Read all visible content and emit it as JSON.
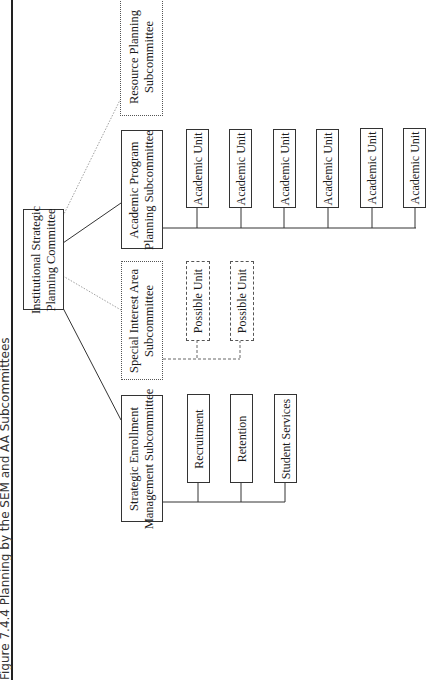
{
  "figure": {
    "title": "Figure 7.4.4 Planning by the SEM and AA Subcommittees"
  },
  "root": {
    "line1": "Institutional Strategic",
    "line2": "Planning Committee"
  },
  "subcommittees": {
    "resource": {
      "line1": "Resource Planning",
      "line2": "Subcommittee",
      "style": "dotted"
    },
    "academic": {
      "line1": "Academic Program",
      "line2": "Planning Subcommittee",
      "style": "solid"
    },
    "special": {
      "line1": "Special Interest Area",
      "line2": "Subcommittee",
      "style": "dotted"
    },
    "enrollment": {
      "line1": "Strategic Enrollment",
      "line2": "Management Subcommittee",
      "style": "solid"
    }
  },
  "academic_units": [
    "Academic Unit",
    "Academic Unit",
    "Academic Unit",
    "Academic Unit",
    "Academic Unit",
    "Academic Unit"
  ],
  "possible_units": [
    "Possible Unit",
    "Possible Unit"
  ],
  "enrollment_units": [
    "Recruitment",
    "Retention",
    "Student Services"
  ],
  "colors": {
    "line": "#333333",
    "dotted_line": "#777777",
    "background": "#ffffff"
  }
}
